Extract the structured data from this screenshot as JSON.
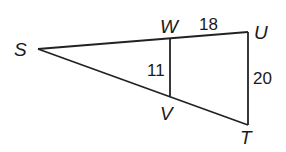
{
  "diagram": {
    "type": "geometry-similar-triangles",
    "stroke_color": "#222222",
    "background": "#ffffff",
    "vertices": {
      "S": {
        "label": "S",
        "x": 38,
        "y": 49
      },
      "W": {
        "label": "W",
        "x": 170,
        "y": 38
      },
      "U": {
        "label": "U",
        "x": 248,
        "y": 32
      },
      "V": {
        "label": "V",
        "x": 170,
        "y": 97
      },
      "T": {
        "label": "T",
        "x": 248,
        "y": 125
      }
    },
    "segments": [
      {
        "from": "S",
        "to": "U"
      },
      {
        "from": "S",
        "to": "T"
      },
      {
        "from": "U",
        "to": "T"
      },
      {
        "from": "W",
        "to": "V"
      }
    ],
    "lengths": {
      "WU": "18",
      "WV": "11",
      "UT": "20"
    }
  }
}
